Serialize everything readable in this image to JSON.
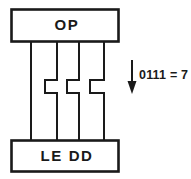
{
  "diagram": {
    "background_color": "#ffffff",
    "line_color": "#1a1a1a",
    "top_unit": {
      "label": "OP",
      "name": "op-block"
    },
    "bottom_unit": {
      "label": "LE DD",
      "name": "ledd-block"
    },
    "bus": {
      "line_count": 4,
      "jog_count": 3
    },
    "annotation": {
      "arrow_direction": "down",
      "label": "0111 = 7",
      "binary": "0111",
      "equals": "=",
      "decimal": "7"
    }
  }
}
